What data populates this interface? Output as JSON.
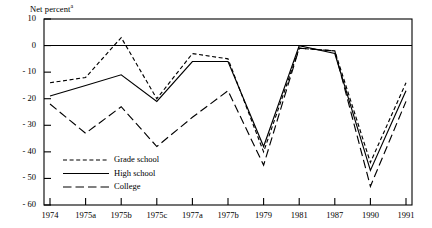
{
  "chart_data": {
    "type": "line",
    "title": "Net percent",
    "title_superscript": "a",
    "xlabel": "",
    "ylabel": "",
    "ylim": [
      -60,
      10
    ],
    "ytick_labels": [
      "10",
      "0",
      "- 10",
      "- 20",
      "- 30",
      "- 40",
      "- 50",
      "- 60"
    ],
    "ytick_values": [
      10,
      0,
      -10,
      -20,
      -30,
      -40,
      -50,
      -60
    ],
    "grid": false,
    "zero_line": true,
    "legend_position": "lower-left-inside",
    "categories": [
      "1974",
      "1975a",
      "1975b",
      "1975c",
      "1977a",
      "1977b",
      "1979",
      "1981",
      "1987",
      "1990",
      "1991"
    ],
    "series": [
      {
        "name": "Grade school",
        "style": "short-dashed",
        "values": [
          -14,
          -12,
          3,
          -20,
          -3,
          -5,
          -40,
          -1,
          -2,
          -44,
          -14
        ]
      },
      {
        "name": "High school",
        "style": "solid",
        "values": [
          -19,
          -15,
          -11,
          -21,
          -6,
          -6,
          -38,
          0,
          -3,
          -47,
          -17
        ]
      },
      {
        "name": "College",
        "style": "long-dashed",
        "values": [
          -22,
          -33,
          -23,
          -38,
          -27,
          -17,
          -45,
          -1,
          -2,
          -53,
          -21
        ]
      }
    ]
  },
  "legend": {
    "items": [
      {
        "label": "Grade school"
      },
      {
        "label": "High school"
      },
      {
        "label": "College"
      }
    ]
  },
  "colors": {
    "line": "#000000",
    "axis": "#000000",
    "background": "#ffffff"
  }
}
